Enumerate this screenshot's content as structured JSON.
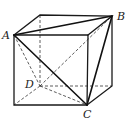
{
  "diagram": {
    "labels": {
      "A": "A",
      "B": "B",
      "C": "C",
      "D": "D"
    },
    "vertices": {
      "A": [
        14,
        35
      ],
      "front_top_right": [
        88,
        35
      ],
      "back_top_left": [
        40,
        15
      ],
      "B": [
        112,
        16
      ],
      "front_bottom_left": [
        14,
        105
      ],
      "C": [
        87,
        105
      ],
      "D": [
        40,
        86
      ],
      "back_bottom_right": [
        112,
        86
      ]
    },
    "solid_edges": [
      [
        "A",
        "front_top_right"
      ],
      [
        "front_top_right",
        "C"
      ],
      [
        "C",
        "front_bottom_left"
      ],
      [
        "front_bottom_left",
        "A"
      ],
      [
        "A",
        "back_top_left"
      ],
      [
        "back_top_left",
        "B"
      ],
      [
        "front_top_right",
        "B"
      ],
      [
        "B",
        "back_bottom_right"
      ],
      [
        "back_bottom_right",
        "C"
      ],
      [
        "A",
        "B"
      ],
      [
        "A",
        "C"
      ],
      [
        "B",
        "C"
      ]
    ],
    "dashed_edges": [
      [
        "back_top_left",
        "D"
      ],
      [
        "D",
        "back_bottom_right"
      ],
      [
        "D",
        "front_bottom_left"
      ],
      [
        "A",
        "D"
      ],
      [
        "D",
        "B"
      ],
      [
        "D",
        "C"
      ]
    ]
  }
}
